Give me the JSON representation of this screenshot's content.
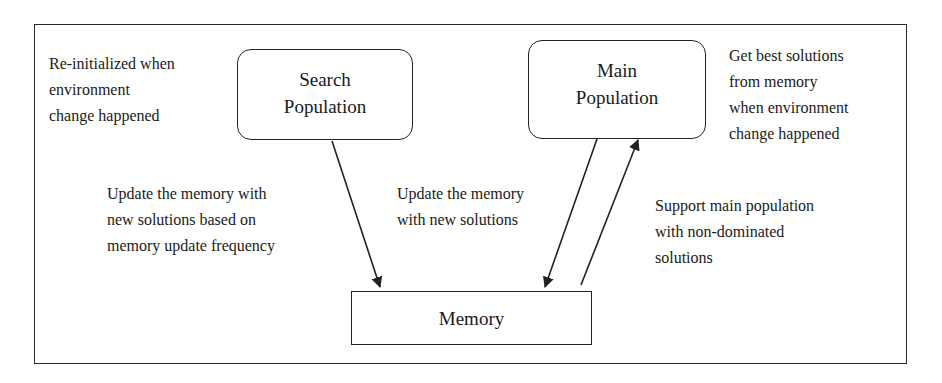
{
  "diagram": {
    "type": "flow-diagram",
    "colors": {
      "line": "#222222",
      "text": "#1a1a1a",
      "background": "#ffffff"
    },
    "nodes": {
      "search_population": {
        "lines": [
          "Search",
          "Population"
        ],
        "shape": "rounded-rectangle"
      },
      "main_population": {
        "lines": [
          "Main",
          "Population"
        ],
        "shape": "rounded-rectangle"
      },
      "memory": {
        "lines": [
          "Memory"
        ],
        "shape": "rectangle"
      }
    },
    "annotations": {
      "search_note": {
        "lines": [
          "Re-initialized when",
          "environment",
          "change happened"
        ]
      },
      "main_note": {
        "lines": [
          "Get best solutions",
          "from memory",
          "when environment",
          "change happened"
        ]
      },
      "search_to_memory": {
        "lines": [
          "Update the memory with",
          "new solutions based on",
          "memory update frequency"
        ]
      },
      "main_to_memory": {
        "lines": [
          "Update the memory",
          "with new solutions"
        ]
      },
      "memory_to_main": {
        "lines": [
          "Support main population",
          "with non-dominated",
          "solutions"
        ]
      }
    },
    "edges": [
      {
        "from": "Search Population",
        "to": "Memory",
        "label": "Update the memory with new solutions based on memory update frequency"
      },
      {
        "from": "Main Population",
        "to": "Memory",
        "label": "Update the memory with new solutions"
      },
      {
        "from": "Memory",
        "to": "Main Population",
        "label": "Support main population with non-dominated solutions"
      }
    ]
  }
}
